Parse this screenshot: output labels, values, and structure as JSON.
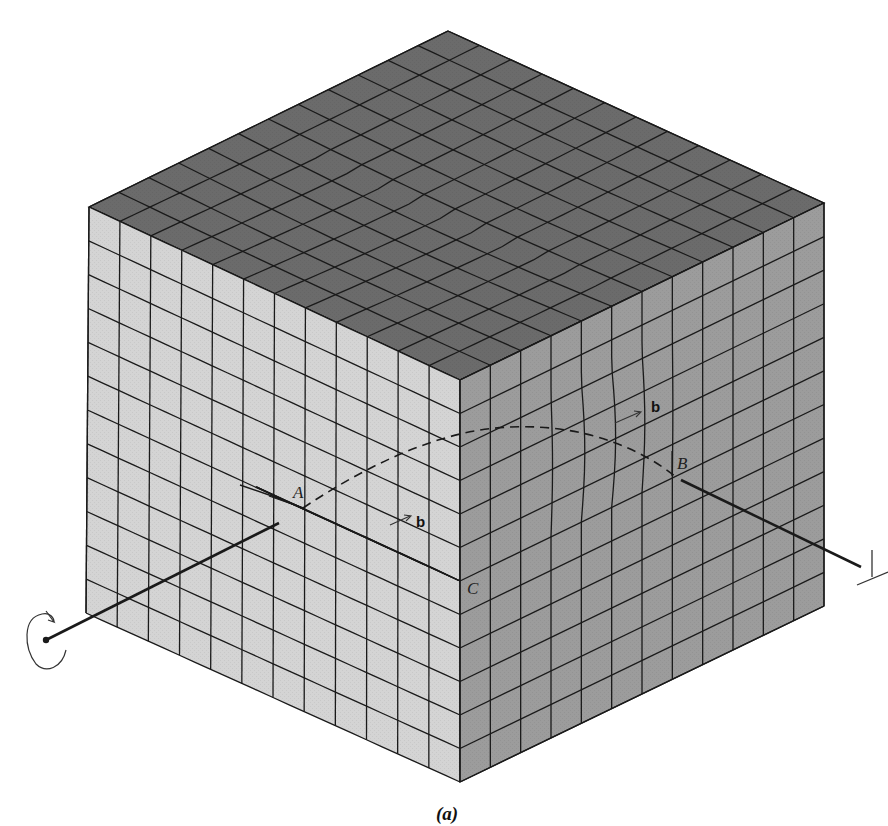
{
  "figure": {
    "caption": "(a)",
    "colors": {
      "background": "#ffffff",
      "top_face": "#6b6b6b",
      "left_face": "#d4d4d4",
      "right_face": "#9c9c9c",
      "step_face": "#c9c9c9",
      "grid_line": "#1a1a1a",
      "dislocation_line": "#1a1a1a"
    },
    "grid": {
      "columns_left": 12,
      "columns_right": 12,
      "rows": 12
    },
    "geometry": {
      "top_vertex": [
        448,
        31
      ],
      "left_top": [
        89,
        207
      ],
      "front_top": [
        460,
        380
      ],
      "right_top": [
        824,
        203
      ],
      "left_bottom": [
        86,
        613
      ],
      "front_bottom": [
        460,
        782
      ],
      "right_bottom": [
        824,
        606
      ]
    },
    "labels": {
      "point_a": "A",
      "point_b": "B",
      "point_c": "C",
      "burgers_vector_top": "b",
      "burgers_vector_step": "b",
      "edge_symbol": "⊥"
    },
    "icons": {
      "screw_rotation": "circular-arrow-icon",
      "edge_dislocation": "perpendicular-symbol-icon"
    }
  }
}
